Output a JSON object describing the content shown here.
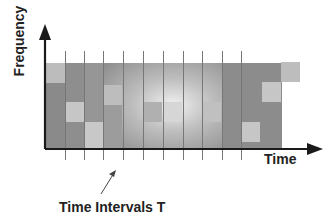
{
  "diagram": {
    "y_axis_label": "Frequency",
    "x_axis_label": "Time",
    "annotation": "Time Intervals T",
    "colors": {
      "axis": "#1a1a1a",
      "grid_line": "#777777",
      "field_dark": "#8f8f8f",
      "field_light": "#f0f0f0",
      "highlight_cell": "#c8c8c8"
    },
    "interval_count": 10
  }
}
